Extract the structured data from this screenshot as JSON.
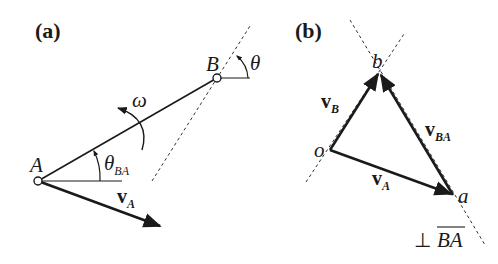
{
  "panels": {
    "a": {
      "label": "(a)",
      "points": {
        "A": {
          "label": "A",
          "x": 38,
          "y": 181
        },
        "B": {
          "label": "B",
          "x": 217,
          "y": 78
        }
      },
      "angular_velocity": {
        "symbol": "ω"
      },
      "angle_link": {
        "symbol": "θ",
        "subscript": "BA"
      },
      "angle_B": {
        "symbol": "θ"
      },
      "velocity_A": {
        "symbol": "v",
        "subscript": "A"
      }
    },
    "b": {
      "label": "(b)",
      "points": {
        "o": {
          "label": "o",
          "x": 330,
          "y": 150
        },
        "a": {
          "label": "a",
          "x": 453,
          "y": 195
        },
        "b": {
          "label": "b",
          "x": 379,
          "y": 72
        }
      },
      "vectors": [
        {
          "symbol": "v",
          "subscript": "B",
          "from": "o",
          "to": "b"
        },
        {
          "symbol": "v",
          "subscript": "A",
          "from": "o",
          "to": "a"
        },
        {
          "symbol": "v",
          "subscript": "BA",
          "from": "a",
          "to": "b"
        }
      ],
      "perpendicular_note": {
        "symbol": "⊥",
        "text": "BA"
      }
    }
  },
  "colors": {
    "ink": "#1a1a1a",
    "background": "#ffffff"
  }
}
